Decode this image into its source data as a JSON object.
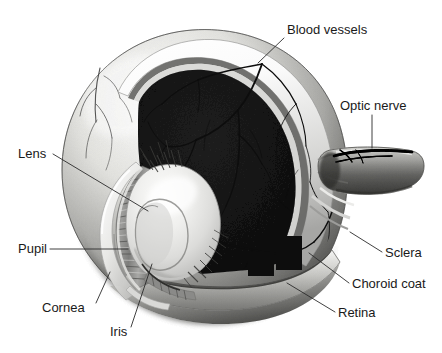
{
  "figure": {
    "background_color": "#ffffff",
    "style": "grayscale medical illustration, cutaway view"
  },
  "colors": {
    "background": "#ffffff",
    "sclera_light": "#f2f2f0",
    "sclera_shadow": "#9a9a98",
    "vitreous_dark": "#4a4a4a",
    "vitreous_darker": "#3a3a3a",
    "lens_highlight": "#f4f4f2",
    "lens_shadow": "#b4b4b2",
    "vessel": "#0d0d0d",
    "label_text": "#1a1a1a",
    "leader_line": "#2b2b2b",
    "choroid_band": "#6e6e6e",
    "iris_band": "#8d8d8b"
  },
  "labels": [
    {
      "id": "blood-vessels",
      "text": "Blood vessels",
      "text_x": 287,
      "text_y": 34,
      "anchor": "start",
      "leader": "M 284 38 L 258 63"
    },
    {
      "id": "optic-nerve",
      "text": "Optic nerve",
      "text_x": 340,
      "text_y": 110,
      "anchor": "start",
      "leader": "M 372 115 L 372 148"
    },
    {
      "id": "lens",
      "text": "Lens",
      "text_x": 18,
      "text_y": 158,
      "anchor": "start",
      "leader": "M 53 154 L 148 211"
    },
    {
      "id": "pupil",
      "text": "Pupil",
      "text_x": 18,
      "text_y": 253,
      "anchor": "start",
      "leader": "M 50 249 L 128 249"
    },
    {
      "id": "cornea",
      "text": "Cornea",
      "text_x": 42,
      "text_y": 312,
      "anchor": "start",
      "leader": "M 96 303 L 110 272"
    },
    {
      "id": "iris",
      "text": "Iris",
      "text_x": 110,
      "text_y": 336,
      "anchor": "start",
      "leader": "M 131 327 L 152 264"
    },
    {
      "id": "sclera",
      "text": "Sclera",
      "text_x": 385,
      "text_y": 257,
      "anchor": "start",
      "leader": "M 382 252 L 350 232"
    },
    {
      "id": "choroid-coat",
      "text": "Choroid coat",
      "text_x": 352,
      "text_y": 288,
      "anchor": "start",
      "leader": "M 349 283 L 309 253"
    },
    {
      "id": "retina",
      "text": "Retina",
      "text_x": 338,
      "text_y": 317,
      "anchor": "start",
      "leader": "M 335 312 L 287 283"
    }
  ],
  "structures": [
    {
      "id": "sclera-shell",
      "name": "Sclera outer shell"
    },
    {
      "id": "vitreous-chamber",
      "name": "Vitreous chamber"
    },
    {
      "id": "retina-layer",
      "name": "Retina layer"
    },
    {
      "id": "choroid-layer",
      "name": "Choroid coat layer"
    },
    {
      "id": "lens-body",
      "name": "Lens"
    },
    {
      "id": "iris-body",
      "name": "Iris and ciliary body"
    },
    {
      "id": "cornea-layer",
      "name": "Cornea"
    },
    {
      "id": "pupil-opening",
      "name": "Pupil"
    },
    {
      "id": "optic-nerve-stalk",
      "name": "Optic nerve"
    },
    {
      "id": "blood-vessel-network",
      "name": "Blood vessels"
    }
  ]
}
